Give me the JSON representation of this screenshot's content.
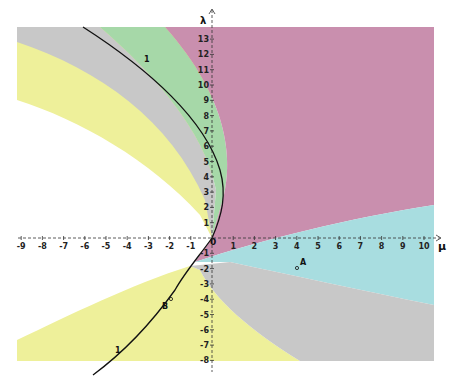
{
  "figure": {
    "axes": {
      "x_label": "μ",
      "y_label": "λ",
      "origin_label": "0",
      "x_ticks": [
        "-9",
        "-8",
        "-7",
        "-6",
        "-5",
        "-4",
        "-3",
        "-2",
        "-1",
        "1",
        "2",
        "3",
        "4",
        "5",
        "6",
        "7",
        "8",
        "9",
        "10"
      ],
      "y_ticks": [
        "13",
        "12",
        "11",
        "10",
        "9",
        "8",
        "7",
        "6",
        "5",
        "4",
        "3",
        "2",
        "1",
        "-1",
        "-2",
        "-3",
        "-4",
        "-5",
        "-6",
        "-7",
        "-8"
      ]
    },
    "curve": {
      "label_top": "1",
      "label_bottom": "1"
    },
    "points": [
      {
        "name": "A",
        "mu": 4,
        "lambda": -2
      },
      {
        "name": "B",
        "mu": -2,
        "lambda": -4
      }
    ],
    "regions": [
      {
        "name": "magenta",
        "color": "#c98fae"
      },
      {
        "name": "green",
        "color": "#a6d8a8"
      },
      {
        "name": "gray",
        "color": "#c8c8c8"
      },
      {
        "name": "yellow",
        "color": "#eef09a"
      },
      {
        "name": "cyan",
        "color": "#a8dde0"
      }
    ]
  }
}
